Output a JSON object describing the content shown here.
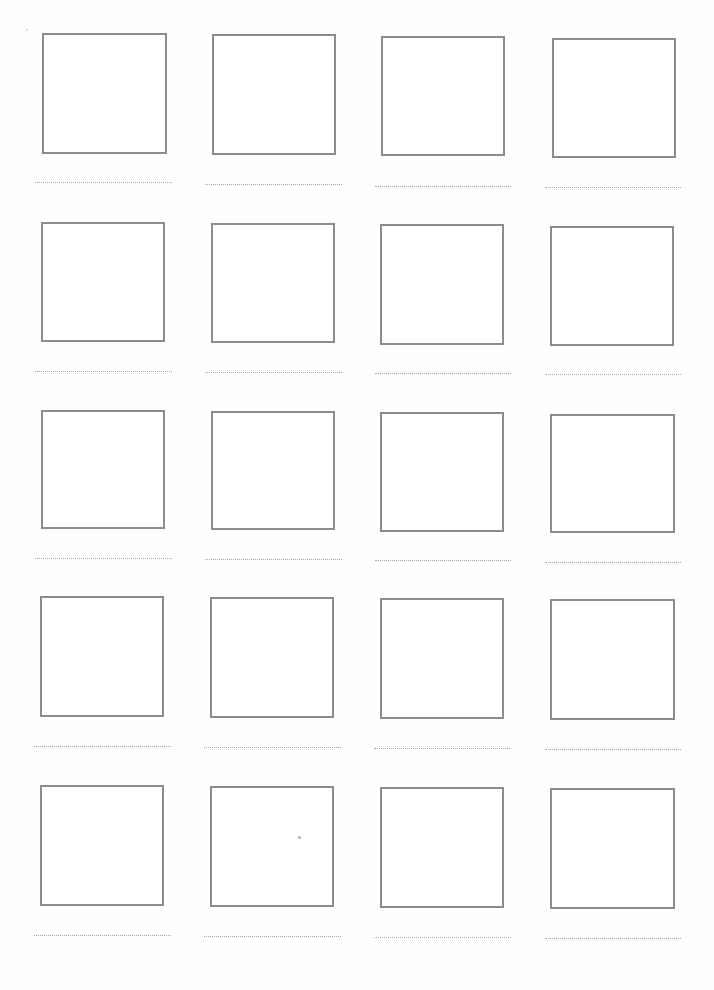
{
  "page": {
    "type": "blank drawing worksheet",
    "rows": 5,
    "columns": 4,
    "colors": {
      "background": "#ffffff",
      "box_border": "#8c8c8c",
      "dotted_line": "#a8a8a8",
      "speck": "#b5b5b5"
    }
  },
  "cells": [
    {
      "row": 1,
      "col": 1,
      "box": {
        "x": 42,
        "y": 33,
        "w": 125,
        "h": 121
      },
      "line": {
        "x": 35,
        "y": 182,
        "w": 137
      },
      "label": ""
    },
    {
      "row": 1,
      "col": 2,
      "box": {
        "x": 212,
        "y": 34,
        "w": 124,
        "h": 121
      },
      "line": {
        "x": 205,
        "y": 184,
        "w": 137
      },
      "label": ""
    },
    {
      "row": 1,
      "col": 3,
      "box": {
        "x": 381,
        "y": 36,
        "w": 124,
        "h": 120
      },
      "line": {
        "x": 375,
        "y": 186,
        "w": 136
      },
      "label": ""
    },
    {
      "row": 1,
      "col": 4,
      "box": {
        "x": 552,
        "y": 38,
        "w": 124,
        "h": 120
      },
      "line": {
        "x": 545,
        "y": 187,
        "w": 136
      },
      "label": ""
    },
    {
      "row": 2,
      "col": 1,
      "box": {
        "x": 41,
        "y": 222,
        "w": 124,
        "h": 120
      },
      "line": {
        "x": 35,
        "y": 371,
        "w": 137
      },
      "label": ""
    },
    {
      "row": 2,
      "col": 2,
      "box": {
        "x": 211,
        "y": 223,
        "w": 124,
        "h": 120
      },
      "line": {
        "x": 205,
        "y": 372,
        "w": 137
      },
      "label": ""
    },
    {
      "row": 2,
      "col": 3,
      "box": {
        "x": 380,
        "y": 224,
        "w": 124,
        "h": 121
      },
      "line": {
        "x": 375,
        "y": 373,
        "w": 136
      },
      "label": ""
    },
    {
      "row": 2,
      "col": 4,
      "box": {
        "x": 550,
        "y": 226,
        "w": 124,
        "h": 120
      },
      "line": {
        "x": 545,
        "y": 374,
        "w": 136
      },
      "label": ""
    },
    {
      "row": 3,
      "col": 1,
      "box": {
        "x": 41,
        "y": 410,
        "w": 124,
        "h": 119
      },
      "line": {
        "x": 35,
        "y": 558,
        "w": 137
      },
      "label": ""
    },
    {
      "row": 3,
      "col": 2,
      "box": {
        "x": 211,
        "y": 411,
        "w": 124,
        "h": 119
      },
      "line": {
        "x": 205,
        "y": 559,
        "w": 137
      },
      "label": ""
    },
    {
      "row": 3,
      "col": 3,
      "box": {
        "x": 380,
        "y": 412,
        "w": 124,
        "h": 120
      },
      "line": {
        "x": 375,
        "y": 560,
        "w": 136
      },
      "label": ""
    },
    {
      "row": 3,
      "col": 4,
      "box": {
        "x": 550,
        "y": 414,
        "w": 125,
        "h": 119
      },
      "line": {
        "x": 545,
        "y": 562,
        "w": 136
      },
      "label": ""
    },
    {
      "row": 4,
      "col": 1,
      "box": {
        "x": 40,
        "y": 596,
        "w": 124,
        "h": 121
      },
      "line": {
        "x": 34,
        "y": 746,
        "w": 137
      },
      "label": ""
    },
    {
      "row": 4,
      "col": 2,
      "box": {
        "x": 210,
        "y": 597,
        "w": 124,
        "h": 121
      },
      "line": {
        "x": 204,
        "y": 747,
        "w": 137
      },
      "label": ""
    },
    {
      "row": 4,
      "col": 3,
      "box": {
        "x": 380,
        "y": 598,
        "w": 124,
        "h": 121
      },
      "line": {
        "x": 374,
        "y": 748,
        "w": 136
      },
      "label": ""
    },
    {
      "row": 4,
      "col": 4,
      "box": {
        "x": 550,
        "y": 599,
        "w": 125,
        "h": 121
      },
      "line": {
        "x": 545,
        "y": 749,
        "w": 136
      },
      "label": ""
    },
    {
      "row": 5,
      "col": 1,
      "box": {
        "x": 40,
        "y": 785,
        "w": 124,
        "h": 121
      },
      "line": {
        "x": 34,
        "y": 935,
        "w": 137
      },
      "label": ""
    },
    {
      "row": 5,
      "col": 2,
      "box": {
        "x": 210,
        "y": 786,
        "w": 124,
        "h": 121
      },
      "line": {
        "x": 204,
        "y": 936,
        "w": 137
      },
      "label": ""
    },
    {
      "row": 5,
      "col": 3,
      "box": {
        "x": 380,
        "y": 787,
        "w": 124,
        "h": 121
      },
      "line": {
        "x": 374,
        "y": 937,
        "w": 137
      },
      "label": ""
    },
    {
      "row": 5,
      "col": 4,
      "box": {
        "x": 550,
        "y": 788,
        "w": 125,
        "h": 121
      },
      "line": {
        "x": 545,
        "y": 938,
        "w": 136
      },
      "label": ""
    }
  ],
  "marks": [
    {
      "name": "corner-speck",
      "x": 26,
      "y": 29,
      "size": "small"
    },
    {
      "name": "pencil-dot",
      "x": 298,
      "y": 836,
      "size": "normal"
    }
  ]
}
